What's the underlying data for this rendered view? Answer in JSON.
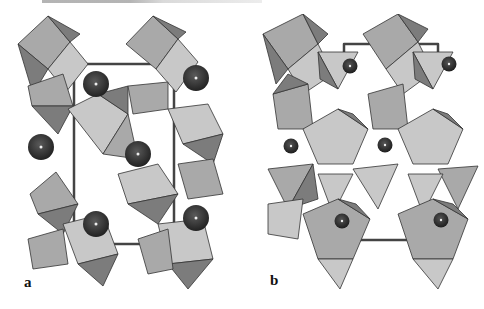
{
  "figure": {
    "panels": [
      {
        "id": "a",
        "label": "a",
        "description": "polyhedral crystal structure view with large dark spheres"
      },
      {
        "id": "b",
        "label": "b",
        "description": "polyhedral crystal structure view with small dark spheres"
      }
    ],
    "colors": {
      "light_face": "#c8c8c8",
      "mid_face": "#a9a9a9",
      "dark_face": "#7c7c7c",
      "edge": "#333333",
      "sphere": "#2e2e2e",
      "cell_line": "#444444"
    }
  }
}
